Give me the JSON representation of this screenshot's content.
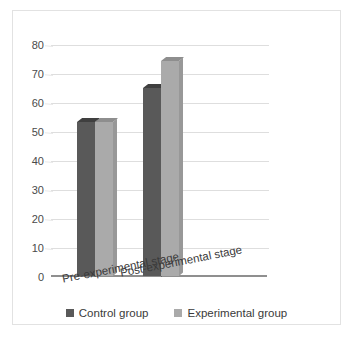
{
  "chart_data": {
    "type": "bar",
    "title": "",
    "subtitle": "",
    "xlabel": "",
    "ylabel": "",
    "categories": [
      "Pre-experimental stage",
      "Post-experimental stage"
    ],
    "series": [
      {
        "name": "Control group",
        "values": [
          53,
          65
        ],
        "color": "#595959"
      },
      {
        "name": "Experimental group",
        "values": [
          53,
          74
        ],
        "color": "#aaaaaa"
      }
    ],
    "ylim": [
      0,
      80
    ],
    "ytick_step": 10,
    "yticks": [
      "0",
      "10",
      "20",
      "30",
      "40",
      "50",
      "60",
      "70",
      "80"
    ],
    "grid": true,
    "grid_axis": "y",
    "legend_position": "bottom",
    "three_d": true,
    "annotations": []
  },
  "legend": {
    "entries": [
      {
        "label": "Control group",
        "swatch": "control-swatch"
      },
      {
        "label": "Experimental group",
        "swatch": "experimental-swatch"
      }
    ]
  },
  "axis": {
    "y_labels": [
      "80",
      "70",
      "60",
      "50",
      "40",
      "30",
      "20",
      "10",
      "0"
    ]
  },
  "categories": {
    "pre": "Pre-experimental stage",
    "post": "Post-experimental stage"
  }
}
